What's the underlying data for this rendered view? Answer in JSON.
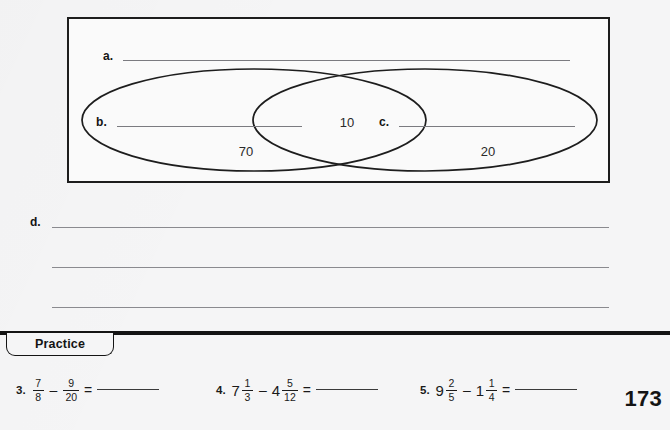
{
  "worksheet": {
    "page_number": "173",
    "diagram": {
      "label_a": "a.",
      "label_b": "b.",
      "label_c": "c.",
      "region_left_value": "70",
      "region_overlap_value": "10",
      "region_right_value": "20"
    },
    "long_answer": {
      "label_d": "d.",
      "line_count": 3
    },
    "practice": {
      "tab_label": "Practice",
      "problems": [
        {
          "number": "3.",
          "terms": [
            {
              "whole": "",
              "numerator": "7",
              "denominator": "8"
            },
            {
              "whole": "",
              "numerator": "9",
              "denominator": "20"
            }
          ],
          "operator": "–",
          "equals": "=",
          "answer": ""
        },
        {
          "number": "4.",
          "terms": [
            {
              "whole": "7",
              "numerator": "1",
              "denominator": "3"
            },
            {
              "whole": "4",
              "numerator": "5",
              "denominator": "12"
            }
          ],
          "operator": "–",
          "equals": "=",
          "answer": ""
        },
        {
          "number": "5.",
          "terms": [
            {
              "whole": "9",
              "numerator": "2",
              "denominator": "5"
            },
            {
              "whole": "1",
              "numerator": "1",
              "denominator": "4"
            }
          ],
          "operator": "–",
          "equals": "=",
          "answer": ""
        }
      ]
    },
    "colors": {
      "paper": "#f5f5f6",
      "ink": "#141414",
      "rule": "#7b7b80"
    }
  }
}
